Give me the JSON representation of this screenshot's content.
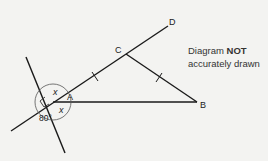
{
  "diagram": {
    "points": {
      "A": {
        "label": "A"
      },
      "B": {
        "label": "B"
      },
      "C": {
        "label": "C"
      },
      "D": {
        "label": "D"
      }
    },
    "angles": {
      "upper": "x",
      "lower": "x",
      "obtuse": "80°"
    },
    "note": {
      "prefix": "Diagram ",
      "emphasis": "NOT",
      "suffix": "accurately drawn"
    }
  }
}
